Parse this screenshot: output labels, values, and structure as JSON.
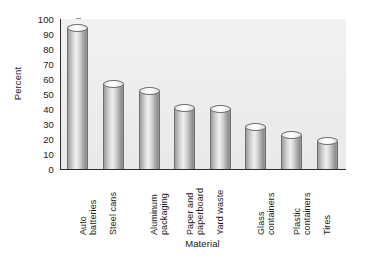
{
  "chart_data": {
    "type": "bar",
    "title": "",
    "xlabel": "Material",
    "ylabel": "Percent",
    "categories": [
      "Auto batteries",
      "Steel cans",
      "Aluminum packaging",
      "Paper and paperboard",
      "Yard waste",
      "Glass containers",
      "Plastic containers",
      "Tires"
    ],
    "category_lines": [
      [
        "Auto",
        "batteries"
      ],
      [
        "Steel cans"
      ],
      [
        "Aluminum",
        "packaging"
      ],
      [
        "Paper and",
        "paperboard"
      ],
      [
        "Yard waste"
      ],
      [
        "Glass",
        "containers"
      ],
      [
        "Plastic",
        "containers"
      ],
      [
        "Tires"
      ]
    ],
    "values": [
      94,
      57,
      52,
      41,
      40,
      28,
      23,
      19
    ],
    "ylim": [
      0,
      100
    ],
    "yticks": [
      0,
      10,
      20,
      30,
      40,
      50,
      60,
      70,
      80,
      90,
      100
    ],
    "ytick_labels": [
      "0",
      "10",
      "20",
      "30",
      "40",
      "50",
      "60",
      "70",
      "80",
      "90",
      "100"
    ],
    "grid": false,
    "legend": null,
    "bar_style": "cylinder",
    "colors": {
      "plot_background": "#efefef",
      "axis": "#2b2b2b",
      "bar_light": "#efefef",
      "bar_dark": "#8e8e8e",
      "text": "#1a1a1a",
      "figure_background": "#ffffff"
    }
  }
}
